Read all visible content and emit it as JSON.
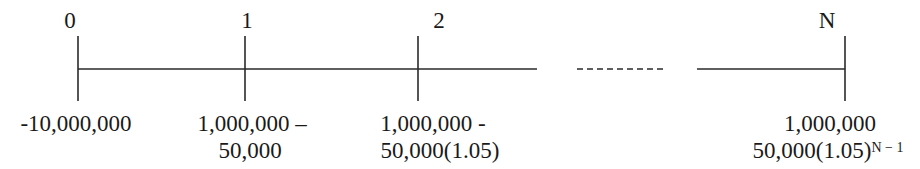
{
  "diagram": {
    "type": "cash-flow-timeline",
    "periods": [
      {
        "label": "0",
        "x": 78,
        "line1": "-10,000,000",
        "line2": "",
        "exp": ""
      },
      {
        "label": "1",
        "x": 245,
        "line1": "1,000,000 –",
        "line2": "50,000",
        "exp": ""
      },
      {
        "label": "2",
        "x": 418,
        "line1": "1,000,000 -",
        "line2": "50,000(1.05)",
        "exp": ""
      },
      {
        "label": "N",
        "x": 845,
        "line1": "1,000,000",
        "line2": "50,000(1.05)",
        "exp": "N − 1"
      }
    ],
    "axis": {
      "y": 69,
      "tick_top": 36,
      "tick_bottom": 101,
      "segments": [
        {
          "x1": 78,
          "x2": 537,
          "style": "solid"
        },
        {
          "x1": 577,
          "x2": 663,
          "style": "dashed"
        },
        {
          "x1": 697,
          "x2": 845,
          "style": "solid"
        }
      ],
      "line_color": "#2a2a2a"
    }
  }
}
